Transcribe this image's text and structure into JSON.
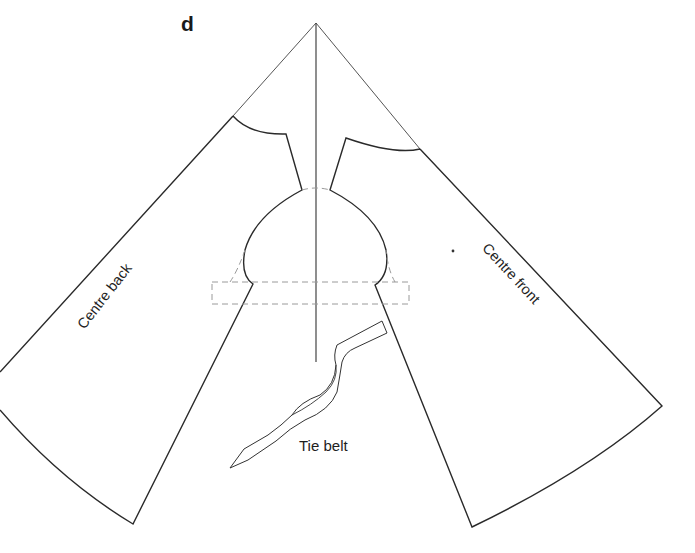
{
  "figure": {
    "label": "d",
    "type": "sewing pattern layout (circular-cut garment with bodice cutaway and tie belt)"
  },
  "pieces": [
    {
      "id": "back",
      "label": "Centre back"
    },
    {
      "id": "front",
      "label": "Centre front"
    },
    {
      "id": "belt",
      "label": "Tie belt"
    }
  ],
  "colors": {
    "line": "#2a2a2a",
    "guide": "#555555",
    "dashed": "#9a9a9a",
    "background": "#ffffff"
  }
}
